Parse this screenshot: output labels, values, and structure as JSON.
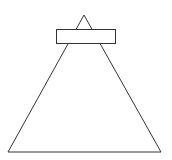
{
  "diagram": {
    "canvas": {
      "width": 172,
      "height": 160,
      "background": "#ffffff"
    },
    "stroke_color": "#333333",
    "shapes": {
      "triangle": {
        "apex": [
          84,
          15
        ],
        "base_left": [
          8,
          152
        ],
        "base_right": [
          161,
          152
        ]
      },
      "rectangle": {
        "x": 56,
        "y": 29,
        "width": 59,
        "height": 14,
        "fill": "#ffffff"
      }
    }
  }
}
